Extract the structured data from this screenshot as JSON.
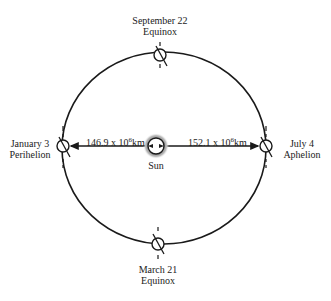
{
  "diagram": {
    "sun": {
      "label": "Sun"
    },
    "positions": [
      {
        "id": "september",
        "date": "September 22",
        "event": "Equinox"
      },
      {
        "id": "january",
        "date": "January 3",
        "event": "Perihelion"
      },
      {
        "id": "july",
        "date": "July 4",
        "event": "Aphelion"
      },
      {
        "id": "march",
        "date": "March 21",
        "event": "Equinox"
      }
    ],
    "distances": {
      "perihelion": {
        "mantissa": "146.9 x 10",
        "exponent": "6",
        "unit": "km"
      },
      "aphelion": {
        "mantissa": "152.1 x 10",
        "exponent": "6",
        "unit": "km"
      }
    },
    "colors": {
      "line": "#1a1a1a",
      "sun_glow": "#9a9a9a",
      "background": "#ffffff"
    }
  }
}
